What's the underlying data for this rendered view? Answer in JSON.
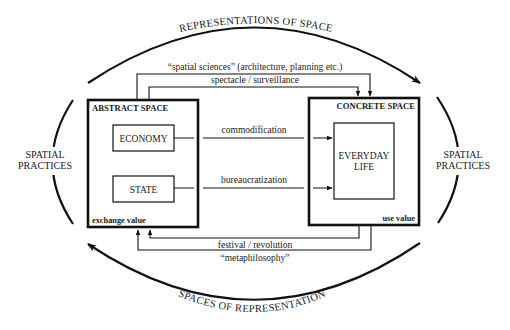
{
  "diagram": {
    "outer_cycle": {
      "top_arc_label": "REPRESENTATIONS OF SPACE",
      "bottom_arc_label": "SPACES OF REPRESENTATION",
      "left_side_label": [
        "SPATIAL",
        "PRACTICES"
      ],
      "right_side_label": [
        "SPATIAL",
        "PRACTICES"
      ]
    },
    "abstract_space": {
      "title": "ABSTRACT SPACE",
      "value_label": "exchange value",
      "inner_boxes": [
        "ECONOMY",
        "STATE"
      ]
    },
    "concrete_space": {
      "title": "CONCRETE SPACE",
      "value_label": "use value",
      "inner_box": [
        "EVERYDAY",
        "LIFE"
      ]
    },
    "connections": {
      "top_outer": "“spatial sciences” (architecture, planning etc.)",
      "top_inner": "spectacle / surveillance",
      "economy_to_life": "commodification",
      "state_to_life": "bureaucratization",
      "bottom_inner": "festival / revolution",
      "bottom_outer": "“metaphilosophy”"
    },
    "colors": {
      "ink": "#111111",
      "background": "#ffffff"
    }
  }
}
